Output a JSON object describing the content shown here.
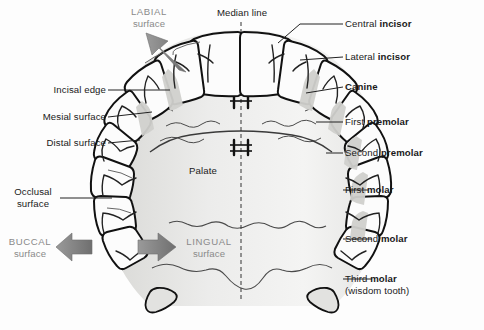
{
  "figure": {
    "background_color": "#fdfdfd",
    "ink_color": "#1a1a1a",
    "accent_gray": "#8a8a8a",
    "palate_fill": "#e8e8e6",
    "tooth_fill": "#fbfbfb",
    "shadow_fill": "#d4d4d2"
  },
  "labels": {
    "labial": {
      "cap": "LABIAL",
      "sub": "surface"
    },
    "median_line": "Median line",
    "incisal_edge": "Incisal edge",
    "mesial_surface": "Mesial surface",
    "distal_surface": "Distal surface",
    "occlusal": {
      "cap": "Occlusal",
      "sub": "surface"
    },
    "buccal": {
      "cap": "BUCCAL",
      "sub": "surface"
    },
    "lingual": {
      "cap": "LINGUAL",
      "sub": "surface"
    },
    "palate": "Palate",
    "central_incisor": {
      "pre": "Central ",
      "bold": "incisor"
    },
    "lateral_incisor": {
      "pre": "Lateral ",
      "bold": "incisor"
    },
    "canine": {
      "pre": "",
      "bold": "Canine"
    },
    "first_premolar": {
      "pre": "First ",
      "bold": "premolar"
    },
    "second_premolar": {
      "pre": "Second ",
      "bold": "premolar"
    },
    "first_molar": {
      "pre": "First ",
      "bold": "molar"
    },
    "second_molar": {
      "pre": "Second ",
      "bold": "molar"
    },
    "third_molar": {
      "pre": "Third ",
      "bold": "molar"
    },
    "third_molar_sub": "(wisdom tooth)"
  }
}
